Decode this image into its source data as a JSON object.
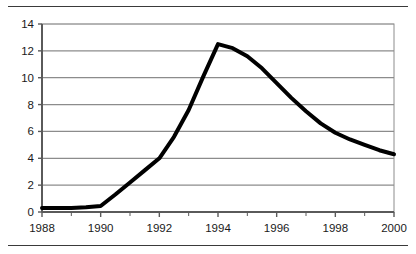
{
  "chart_data": {
    "type": "line",
    "title": "",
    "subtitle": "",
    "xlabel": "",
    "ylabel": "",
    "xlim": [
      1988,
      2000
    ],
    "ylim": [
      0,
      14
    ],
    "grid": true,
    "grid_axis": "y",
    "legend": false,
    "legend_position": "none",
    "x_tick_labels": [
      "1988",
      "1990",
      "1992",
      "1994",
      "1996",
      "1998",
      "2000"
    ],
    "x_tick_values": [
      1988,
      1990,
      1992,
      1994,
      1996,
      1998,
      2000
    ],
    "x_minor_ticks": [
      1989,
      1991,
      1993,
      1995,
      1997,
      1999
    ],
    "y_tick_labels": [
      "0",
      "2",
      "4",
      "6",
      "8",
      "10",
      "12",
      "14"
    ],
    "y_tick_values": [
      0,
      2,
      4,
      6,
      8,
      10,
      12,
      14
    ],
    "series": [
      {
        "name": "series-1",
        "color": "#000000",
        "line_width": 4,
        "x": [
          1988,
          1988.5,
          1989,
          1989.5,
          1990,
          1990.5,
          1991,
          1991.5,
          1992,
          1992.5,
          1993,
          1993.5,
          1994,
          1994.5,
          1995,
          1995.5,
          1996,
          1996.5,
          1997,
          1997.5,
          1998,
          1998.5,
          1999,
          1999.5,
          2000
        ],
        "values": [
          0.3,
          0.3,
          0.3,
          0.35,
          0.45,
          1.3,
          2.2,
          3.1,
          4.0,
          5.6,
          7.6,
          10.1,
          12.5,
          12.2,
          11.6,
          10.7,
          9.6,
          8.5,
          7.5,
          6.6,
          5.9,
          5.4,
          5.0,
          4.6,
          4.3
        ]
      }
    ],
    "annotations": [],
    "style": {
      "gridline_color": "#8c8c8c",
      "axis_color": "#5a5a5a",
      "plot_border_color": "#8c8c8c",
      "background": "#ffffff",
      "rule_color": "#3a3a3a",
      "tick_text_color": "#1a1a1a"
    }
  }
}
